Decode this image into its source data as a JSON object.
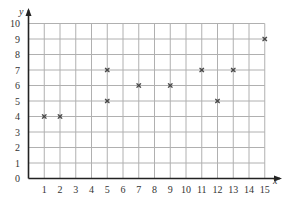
{
  "chart_data": {
    "type": "scatter",
    "title": "",
    "xlabel": "x",
    "ylabel": "y",
    "xlim": [
      0,
      15
    ],
    "ylim": [
      0,
      10
    ],
    "grid": true,
    "x_ticks": [
      1,
      2,
      3,
      4,
      5,
      6,
      7,
      8,
      9,
      10,
      11,
      12,
      13,
      14,
      15
    ],
    "y_ticks": [
      0,
      1,
      2,
      3,
      4,
      5,
      6,
      7,
      8,
      9,
      10
    ],
    "points": [
      {
        "x": 1,
        "y": 4
      },
      {
        "x": 2,
        "y": 4
      },
      {
        "x": 5,
        "y": 5
      },
      {
        "x": 5,
        "y": 7
      },
      {
        "x": 7,
        "y": 6
      },
      {
        "x": 9,
        "y": 6
      },
      {
        "x": 11,
        "y": 7
      },
      {
        "x": 12,
        "y": 5
      },
      {
        "x": 13,
        "y": 7
      },
      {
        "x": 15,
        "y": 9
      }
    ],
    "marker": "x",
    "colors": {
      "grid": "#b0b0b0",
      "axis": "#222222",
      "marker": "#444444"
    }
  }
}
